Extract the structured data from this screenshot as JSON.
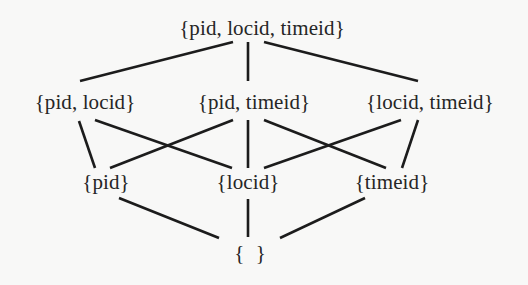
{
  "diagram": {
    "type": "lattice",
    "title": "",
    "line_color": "#1c1c1c",
    "text_color": "#262626",
    "background": "#f8f8f7",
    "nodes": [
      {
        "id": "top",
        "label": "{pid, locid, timeid}",
        "level": 0
      },
      {
        "id": "pid_locid",
        "label": "{pid, locid}",
        "level": 1
      },
      {
        "id": "pid_timeid",
        "label": "{pid, timeid}",
        "level": 1
      },
      {
        "id": "locid_timeid",
        "label": "{locid, timeid}",
        "level": 1
      },
      {
        "id": "pid",
        "label": "{pid}",
        "level": 2
      },
      {
        "id": "locid",
        "label": "{locid}",
        "level": 2
      },
      {
        "id": "timeid",
        "label": "{timeid}",
        "level": 2
      },
      {
        "id": "empty",
        "label": "{ }",
        "level": 3
      }
    ],
    "edges": [
      {
        "from": "top",
        "to": "pid_locid"
      },
      {
        "from": "top",
        "to": "pid_timeid"
      },
      {
        "from": "top",
        "to": "locid_timeid"
      },
      {
        "from": "pid_locid",
        "to": "pid"
      },
      {
        "from": "pid_locid",
        "to": "locid"
      },
      {
        "from": "pid_timeid",
        "to": "pid"
      },
      {
        "from": "pid_timeid",
        "to": "locid"
      },
      {
        "from": "pid_timeid",
        "to": "timeid"
      },
      {
        "from": "locid_timeid",
        "to": "locid"
      },
      {
        "from": "locid_timeid",
        "to": "timeid"
      },
      {
        "from": "pid",
        "to": "empty"
      },
      {
        "from": "locid",
        "to": "empty"
      },
      {
        "from": "timeid",
        "to": "empty"
      }
    ]
  }
}
